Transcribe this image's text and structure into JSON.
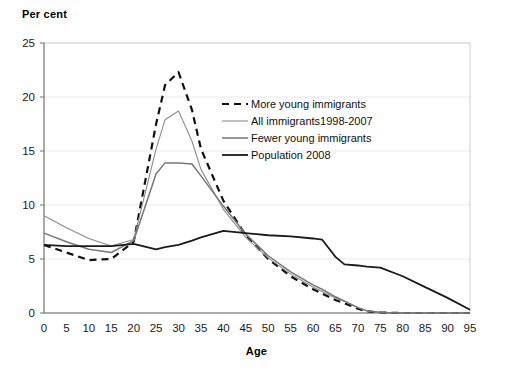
{
  "chart_data": {
    "type": "line",
    "title": "",
    "ylabel": "Per cent",
    "xlabel": "Age",
    "xlim": [
      0,
      95
    ],
    "ylim": [
      0,
      25
    ],
    "xticks": [
      0,
      5,
      10,
      15,
      20,
      25,
      30,
      35,
      40,
      45,
      50,
      55,
      60,
      65,
      70,
      75,
      80,
      85,
      90,
      95
    ],
    "yticks": [
      0,
      5,
      10,
      15,
      20,
      25
    ],
    "grid": "horizontal-faint",
    "legend_position": "upper-center-right",
    "x": [
      0,
      5,
      10,
      15,
      20,
      25,
      27,
      30,
      33,
      35,
      40,
      45,
      50,
      55,
      60,
      62,
      65,
      67,
      70,
      72,
      75,
      80,
      85,
      90,
      95
    ],
    "series": [
      {
        "name": "More young immigrants",
        "style": "dashed",
        "color": "#111111",
        "width": 2.2,
        "values": [
          6.3,
          5.6,
          4.9,
          5.0,
          6.6,
          17.5,
          21.1,
          22.3,
          18.8,
          15.2,
          10.4,
          7.2,
          5.0,
          3.4,
          2.2,
          1.8,
          1.2,
          0.9,
          0.4,
          0.15,
          0.05,
          0.0,
          0.0,
          0.0,
          0.0
        ]
      },
      {
        "name": "All immigrants1998-2007",
        "style": "solid",
        "color": "#8c8c8c",
        "width": 1.1,
        "values": [
          9.0,
          7.9,
          6.9,
          6.2,
          6.8,
          15.2,
          17.9,
          18.7,
          15.9,
          13.3,
          9.6,
          7.0,
          5.1,
          3.6,
          2.4,
          2.0,
          1.4,
          1.1,
          0.5,
          0.2,
          0.05,
          0.0,
          0.0,
          0.0,
          0.0
        ]
      },
      {
        "name": "Fewer young immigrants",
        "style": "solid",
        "color": "#777777",
        "width": 1.5,
        "values": [
          7.4,
          6.6,
          5.9,
          5.6,
          6.7,
          12.9,
          13.9,
          13.9,
          13.8,
          12.7,
          9.9,
          7.3,
          5.3,
          3.8,
          2.6,
          2.2,
          1.5,
          1.1,
          0.5,
          0.2,
          0.05,
          0.0,
          0.0,
          0.0,
          0.0
        ]
      },
      {
        "name": "Population 2008",
        "style": "solid",
        "color": "#1a1a1a",
        "width": 1.8,
        "values": [
          6.3,
          6.2,
          6.2,
          6.2,
          6.4,
          5.9,
          6.1,
          6.3,
          6.7,
          7.0,
          7.6,
          7.4,
          7.2,
          7.1,
          6.9,
          6.8,
          5.2,
          4.5,
          4.4,
          4.3,
          4.2,
          3.4,
          2.4,
          1.4,
          0.3
        ]
      }
    ]
  },
  "legend": {
    "items": [
      {
        "label": "More young immigrants"
      },
      {
        "label": "All immigrants1998-2007"
      },
      {
        "label": "Fewer young immigrants"
      },
      {
        "label": "Population 2008"
      }
    ]
  }
}
